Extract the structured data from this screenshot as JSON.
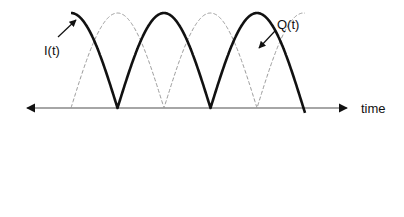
{
  "diagram": {
    "labels": {
      "in_phase": "I(t)",
      "quadrature": "Q(t)",
      "axis": "time"
    },
    "colors": {
      "background": "#ffffff",
      "i_curve": "#111111",
      "q_curve": "#9a9a9a",
      "axis": "#888888",
      "text": "#111111"
    },
    "geometry": {
      "axis_y": 108,
      "axis_x_start": 25,
      "axis_x_end": 349,
      "amplitude": 95,
      "half_period_px": 93,
      "i_curve": {
        "start_x": 71,
        "end_x": 305,
        "description": "rectified cosine for two half-periods, then negative half-cycle"
      },
      "q_curve": {
        "start_x": 71,
        "end_x": 305,
        "description": "dashed, 90° phase-shifted from I(t)"
      }
    }
  }
}
